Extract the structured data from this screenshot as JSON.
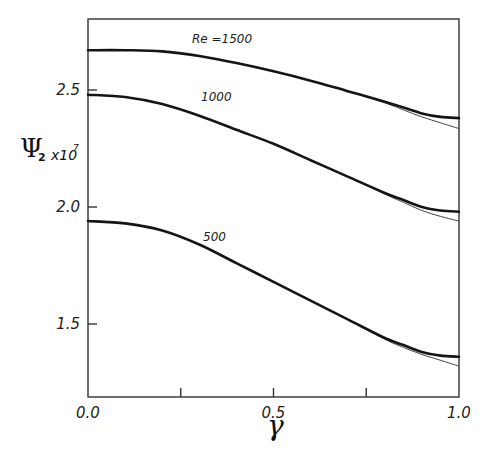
{
  "chart_data": {
    "type": "line",
    "title": "",
    "xlabel": "γ",
    "ylabel": "Ψ2 x10^7",
    "ylabel_parts": {
      "symbol": "Ψ",
      "subscript": "2",
      "multiplier": "x10",
      "exponent": "7"
    },
    "xlim": [
      0.0,
      1.0
    ],
    "ylim": [
      1.21,
      2.81
    ],
    "x_ticks": [
      0.0,
      0.25,
      0.5,
      0.75,
      1.0
    ],
    "x_tick_labels": [
      "0.0",
      "",
      "0.5",
      "",
      "1.0"
    ],
    "y_ticks": [
      1.5,
      2.0,
      2.5
    ],
    "y_tick_labels": [
      "1.5",
      "2.0",
      "2.5"
    ],
    "grid": false,
    "legend": "inline curve labels",
    "x": [
      0.0,
      0.1,
      0.2,
      0.3,
      0.4,
      0.5,
      0.6,
      0.7,
      0.8,
      0.85,
      0.9,
      0.95,
      1.0
    ],
    "series": [
      {
        "name": "Re =1500",
        "label": "Re =1500",
        "style": "thick",
        "values": [
          2.67,
          2.67,
          2.665,
          2.645,
          2.615,
          2.58,
          2.54,
          2.495,
          2.45,
          2.425,
          2.4,
          2.385,
          2.38
        ]
      },
      {
        "name": "Re =1500 (approx)",
        "label": "",
        "style": "thin",
        "values": [
          2.67,
          2.67,
          2.665,
          2.645,
          2.615,
          2.58,
          2.54,
          2.495,
          2.445,
          2.415,
          2.385,
          2.36,
          2.335
        ]
      },
      {
        "name": "1000",
        "label": "1000",
        "style": "thick",
        "values": [
          2.48,
          2.47,
          2.44,
          2.39,
          2.33,
          2.27,
          2.2,
          2.13,
          2.06,
          2.03,
          2.0,
          1.985,
          1.98
        ]
      },
      {
        "name": "1000 (approx)",
        "label": "",
        "style": "thin",
        "values": [
          2.48,
          2.47,
          2.44,
          2.39,
          2.33,
          2.27,
          2.2,
          2.13,
          2.055,
          2.02,
          1.985,
          1.96,
          1.94
        ]
      },
      {
        "name": "500",
        "label": "500",
        "style": "thick",
        "values": [
          1.94,
          1.93,
          1.9,
          1.84,
          1.76,
          1.68,
          1.6,
          1.52,
          1.44,
          1.41,
          1.38,
          1.365,
          1.36
        ]
      },
      {
        "name": "500 (approx)",
        "label": "",
        "style": "thin",
        "values": [
          1.94,
          1.93,
          1.9,
          1.84,
          1.76,
          1.68,
          1.6,
          1.52,
          1.435,
          1.4,
          1.37,
          1.345,
          1.32
        ]
      }
    ]
  }
}
